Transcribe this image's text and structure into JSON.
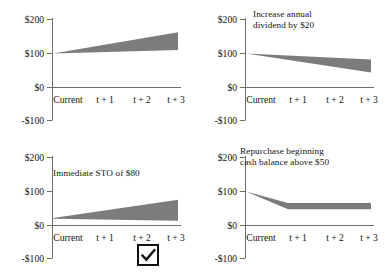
{
  "figure": {
    "panel_count": 4,
    "shade_color": "#7c7c7c",
    "axis_color": "#6e6e6e",
    "text_color": "#141414"
  },
  "axes": {
    "y_ticks": [
      "$200",
      "$100",
      "$0",
      "-$100"
    ],
    "y_values": [
      200,
      100,
      0,
      -100
    ],
    "x_ticks": [
      "Current",
      "t + 1",
      "t + 2",
      "t + 3"
    ]
  },
  "panels": [
    {
      "id": "panel-baseline",
      "caption": "",
      "band_upper": [
        100,
        118,
        140,
        162
      ],
      "band_lower": [
        100,
        104,
        107,
        110
      ]
    },
    {
      "id": "panel-increase-dividend",
      "caption": "Increase annual\ndividend by $20",
      "band_upper": [
        100,
        94,
        88,
        82
      ],
      "band_lower": [
        100,
        80,
        62,
        44
      ]
    },
    {
      "id": "panel-immediate-sto",
      "caption": "Immediate STO of $80",
      "band_upper": [
        22,
        40,
        58,
        76
      ],
      "band_lower": [
        20,
        18,
        16,
        14
      ]
    },
    {
      "id": "panel-repurchase-cash",
      "caption": "Repurchase beginning\ncash balance above $50",
      "band_upper": [
        100,
        66,
        66,
        66
      ],
      "band_lower": [
        100,
        48,
        48,
        48
      ]
    }
  ],
  "chart_data": {
    "type": "area",
    "title": "",
    "xlabel": "",
    "ylabel": "",
    "x": [
      "Current",
      "t + 1",
      "t + 2",
      "t + 3"
    ],
    "ylim": [
      -100,
      200
    ],
    "grid": false,
    "legend": "none",
    "series": [
      {
        "name": "Baseline upper",
        "panel": 1,
        "values": [
          100,
          118,
          140,
          162
        ]
      },
      {
        "name": "Baseline lower",
        "panel": 1,
        "values": [
          100,
          104,
          107,
          110
        ]
      },
      {
        "name": "Increase annual dividend by $20 upper",
        "panel": 2,
        "values": [
          100,
          94,
          88,
          82
        ]
      },
      {
        "name": "Increase annual dividend by $20 lower",
        "panel": 2,
        "values": [
          100,
          80,
          62,
          44
        ]
      },
      {
        "name": "Immediate STO of $80 upper",
        "panel": 3,
        "values": [
          22,
          40,
          58,
          76
        ]
      },
      {
        "name": "Immediate STO of $80 lower",
        "panel": 3,
        "values": [
          20,
          18,
          16,
          14
        ]
      },
      {
        "name": "Repurchase beginning cash balance above $50 upper",
        "panel": 4,
        "values": [
          100,
          66,
          66,
          66
        ]
      },
      {
        "name": "Repurchase beginning cash balance above $50 lower",
        "panel": 4,
        "values": [
          100,
          48,
          48,
          48
        ]
      }
    ],
    "annotations": [
      "Increase annual dividend by $20",
      "Immediate STO of $80",
      "Repurchase beginning cash balance above $50"
    ]
  },
  "selection": {
    "checked": true,
    "checkmark": "✓",
    "for_panel": "panel-immediate-sto"
  }
}
